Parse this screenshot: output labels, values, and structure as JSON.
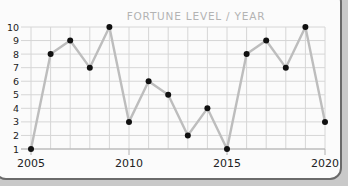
{
  "chart_data": {
    "type": "line",
    "title": "FORTUNE LEVEL / YEAR",
    "xlabel": "",
    "ylabel": "",
    "x": [
      2005,
      2006,
      2007,
      2008,
      2009,
      2010,
      2011,
      2012,
      2013,
      2014,
      2015,
      2016,
      2017,
      2018,
      2019,
      2020
    ],
    "values": [
      1,
      8,
      9,
      7,
      10,
      3,
      6,
      5,
      2,
      4,
      1,
      8,
      9,
      7,
      10,
      3
    ],
    "xlim": [
      2005,
      2020
    ],
    "ylim": [
      1,
      10
    ],
    "x_ticks": [
      "2005",
      "2010",
      "2015",
      "2020"
    ],
    "y_ticks": [
      "1",
      "2",
      "3",
      "4",
      "5",
      "6",
      "7",
      "8",
      "9",
      "10"
    ],
    "grid": true,
    "legend": null,
    "colors": {
      "line": "#bdbdbd",
      "marker": "#111111",
      "grid": "#d6d6d6"
    }
  }
}
